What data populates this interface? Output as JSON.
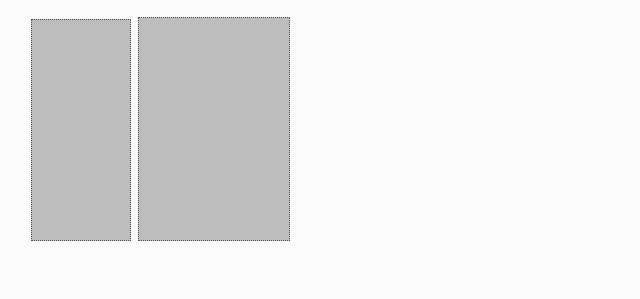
{
  "panels": [
    {
      "id": "1",
      "marker": "①"
    },
    {
      "id": "2",
      "marker": "②"
    },
    {
      "id": "3",
      "marker": "③"
    }
  ],
  "input": {
    "label_line1": "Interference",
    "label_line2": "Metrics",
    "icon": "table-with-person-icon"
  },
  "svm": {
    "title": "SVM",
    "subtitle": "(supervised)"
  },
  "kmeans": {
    "title": "K-Means",
    "subtitle": "(unsupervised)"
  },
  "class_header": "CLASS:",
  "level_header": "LEVEL:",
  "classes": [
    {
      "label": "Memory",
      "cells": 8
    },
    {
      "label": "CPU",
      "cells": 8
    },
    {
      "label": "Disk",
      "cells": 8
    },
    {
      "label": "Network",
      "cells": 8
    },
    {
      "label": "Cache",
      "cells": 8
    }
  ],
  "levels": [
    {
      "label": "Memory",
      "icon": "signal-bars-icon"
    },
    {
      "label": "CPU",
      "icon": "signal-bars-icon"
    },
    {
      "label": "Disk",
      "icon": "signal-bars-icon"
    },
    {
      "label": "Network",
      "icon": "signal-bars-icon"
    },
    {
      "label": "Cache",
      "icon": "signal-bars-icon"
    }
  ],
  "training": {
    "label": "Training Dataset"
  },
  "colors": {
    "panel_bg": "#bdbdbd",
    "box_bg": "#ececec",
    "stroke": "#333333",
    "icon_tint": "#7a6a66"
  }
}
